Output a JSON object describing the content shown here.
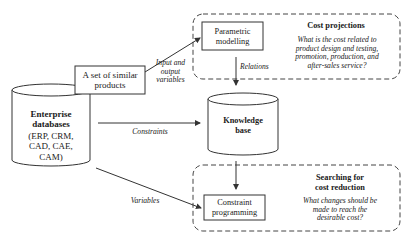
{
  "diagram": {
    "nodes": {
      "enterprise_db": {
        "title_line1": "Enterprise",
        "title_line2": "databases",
        "sub_line1": "(ERP, CRM,",
        "sub_line2": "CAD, CAE,",
        "sub_line3": "CAM)"
      },
      "similar_products": {
        "line1": "A set of similar",
        "line2": "products"
      },
      "parametric": {
        "line1": "Parametric",
        "line2": "modelling"
      },
      "knowledge_base": {
        "line1": "Knowledge",
        "line2": "base"
      },
      "constraint_programming": {
        "line1": "Constraint",
        "line2": "programming"
      }
    },
    "regions": {
      "cost_projections": {
        "title": "Cost projections",
        "q_line1": "What is the cost related to",
        "q_line2": "product design and testing,",
        "q_line3": "promotion, production, and",
        "q_line4": "after-sales service?"
      },
      "cost_reduction": {
        "title_line1": "Searching for",
        "title_line2": "cost reduction",
        "q_line1": "What changes should be",
        "q_line2": "made to reach the",
        "q_line3": "desirable cost?"
      }
    },
    "edge_labels": {
      "input_output_line1": "Input and",
      "input_output_line2": "output",
      "input_output_line3": "variables",
      "relations": "Relations",
      "constraints": "Constraints",
      "variables": "Variables"
    },
    "colors": {
      "stroke": "#333333",
      "background": "#ffffff"
    }
  }
}
